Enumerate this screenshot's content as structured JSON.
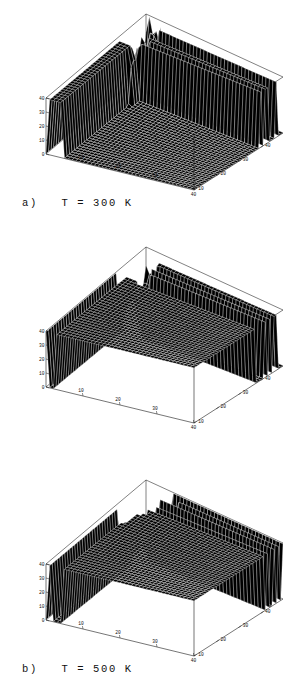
{
  "figure": {
    "panel_count": 3,
    "style": "wireframe-box-3d-hidden-line-surface"
  },
  "panels": [
    {
      "id": "a",
      "label": "a)",
      "caption": "a)   T = 300 K",
      "temperature_value": "300",
      "temperature_unit": "K",
      "temperature_label": "T = 300 K"
    },
    {
      "id": "b",
      "label": "b)",
      "caption": "b)   T = 500 K",
      "temperature_value": "500",
      "temperature_unit": "K",
      "temperature_label": "T = 500 K"
    },
    {
      "id": "c",
      "label": "c)",
      "caption": "c)   T = 700 K",
      "temperature_value": "700",
      "temperature_unit": "K",
      "temperature_label": "T = 700 K"
    }
  ],
  "chart_data": [
    {
      "type": "surface",
      "panel": "a",
      "title": "a)   T = 300 K",
      "xlabel": "",
      "ylabel": "",
      "zlabel": "",
      "xlim": [
        0,
        40
      ],
      "ylim": [
        0,
        40
      ],
      "zlim": [
        0,
        40
      ],
      "x_ticks": [
        "10",
        "20",
        "30",
        "40"
      ],
      "y_ticks": [
        "10",
        "20",
        "30",
        "40"
      ],
      "z_ticks": [
        "0",
        "10",
        "20",
        "30",
        "40"
      ],
      "grid": false,
      "legend": "none",
      "grid_size": [
        40,
        40
      ],
      "surface_color": "#000000",
      "mesh_color": "#ffffff",
      "roughness_rms": 9.5,
      "mean_height": 20,
      "peak_height": 40,
      "character": "very rough; tall narrow isolated spikes spanning nearly the full z range"
    },
    {
      "type": "surface",
      "panel": "b",
      "title": "b)   T = 500 K",
      "xlabel": "",
      "ylabel": "",
      "zlabel": "",
      "xlim": [
        0,
        40
      ],
      "ylim": [
        0,
        40
      ],
      "zlim": [
        0,
        40
      ],
      "x_ticks": [
        "10",
        "20",
        "30",
        "40"
      ],
      "y_ticks": [
        "10",
        "20",
        "30",
        "40"
      ],
      "z_ticks": [
        "0",
        "10",
        "20",
        "30",
        "40"
      ],
      "grid": false,
      "legend": "none",
      "grid_size": [
        40,
        40
      ],
      "surface_color": "#000000",
      "mesh_color": "#ffffff",
      "roughness_rms": 5.5,
      "mean_height": 17,
      "peak_height": 33,
      "character": "moderately rough; broader coalesced mounds, reduced spike amplitude"
    },
    {
      "type": "surface",
      "panel": "c",
      "title": "c)   T = 700 K",
      "xlabel": "",
      "ylabel": "",
      "zlabel": "",
      "xlim": [
        0,
        40
      ],
      "ylim": [
        0,
        40
      ],
      "zlim": [
        0,
        40
      ],
      "x_ticks": [
        "10",
        "20",
        "30",
        "40"
      ],
      "y_ticks": [
        "10",
        "20",
        "30",
        "40"
      ],
      "z_ticks": [
        "0",
        "10",
        "20",
        "30",
        "40"
      ],
      "grid": false,
      "legend": "none",
      "grid_size": [
        40,
        40
      ],
      "surface_color": "#000000",
      "mesh_color": "#ffffff",
      "roughness_rms": 1.2,
      "mean_height": 9,
      "peak_height": 12,
      "character": "nearly flat smooth plane with fine speckled mesh texture"
    }
  ],
  "axes": {
    "z_tick_labels": [
      "40",
      "30",
      "20",
      "10",
      "0"
    ],
    "x_tick_labels": [
      "10",
      "20",
      "30",
      "40"
    ],
    "y_tick_labels": [
      "40",
      "30",
      "20",
      "10"
    ],
    "corner_label": "40"
  }
}
